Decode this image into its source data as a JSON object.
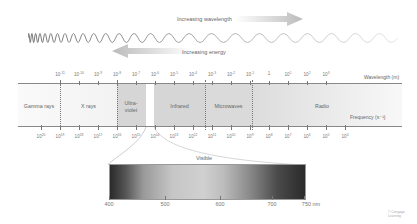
{
  "top_arrows": {
    "wavelength_label": "Increasing wavelength",
    "energy_label": "Increasing energy"
  },
  "axis_labels": {
    "wavelength": "Wavelength (m)",
    "frequency": "Frequency (s⁻¹)"
  },
  "wavelength_ticks": [
    {
      "b": "10",
      "e": "-11"
    },
    {
      "b": "10",
      "e": "-10"
    },
    {
      "b": "10",
      "e": "-9"
    },
    {
      "b": "10",
      "e": "-8"
    },
    {
      "b": "10",
      "e": "-7"
    },
    {
      "b": "10",
      "e": "-6"
    },
    {
      "b": "10",
      "e": "-5"
    },
    {
      "b": "10",
      "e": "-4"
    },
    {
      "b": "10",
      "e": "-3"
    },
    {
      "b": "10",
      "e": "-2"
    },
    {
      "b": "10",
      "e": "-1"
    },
    {
      "b": "1",
      "e": ""
    },
    {
      "b": "10",
      "e": "1"
    },
    {
      "b": "10",
      "e": "2"
    },
    {
      "b": "10",
      "e": "3"
    }
  ],
  "frequency_ticks": [
    {
      "b": "10",
      "e": "20"
    },
    {
      "b": "10",
      "e": "19"
    },
    {
      "b": "10",
      "e": "18"
    },
    {
      "b": "10",
      "e": "17"
    },
    {
      "b": "10",
      "e": "16"
    },
    {
      "b": "10",
      "e": "15"
    },
    {
      "b": "10",
      "e": "14"
    },
    {
      "b": "10",
      "e": "13"
    },
    {
      "b": "10",
      "e": "12"
    },
    {
      "b": "10",
      "e": "11"
    },
    {
      "b": "10",
      "e": "10"
    },
    {
      "b": "10",
      "e": "9"
    },
    {
      "b": "10",
      "e": "8"
    },
    {
      "b": "10",
      "e": "7"
    },
    {
      "b": "10",
      "e": "6"
    },
    {
      "b": "10",
      "e": "5"
    },
    {
      "b": "10",
      "e": "4"
    }
  ],
  "bands": {
    "gamma": "Gamma rays",
    "xray": "X rays",
    "uv": "Ultra-violet",
    "infrared": "Infrared",
    "microwaves": "Microwaves",
    "radio": "Radio"
  },
  "visible": {
    "title": "Visible",
    "ticks": [
      "400",
      "500",
      "600",
      "700",
      "750 nm"
    ]
  },
  "credit": "© Cengage Learning"
}
